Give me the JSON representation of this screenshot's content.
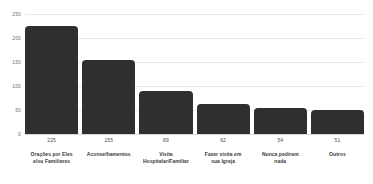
{
  "chart_data": {
    "type": "bar",
    "title": "",
    "subtitle": "",
    "xlabel": "",
    "ylabel": "",
    "ylim": [
      0,
      250
    ],
    "yticks": [
      0,
      50,
      100,
      150,
      200,
      250
    ],
    "ytick_labels": [
      "0",
      "50",
      "100",
      "150",
      "200",
      "250"
    ],
    "grid": true,
    "legend": false,
    "bar_color": "#2f2f2f",
    "gridline_color": "#e9e9e9",
    "background_color": "#ffffff",
    "categories": [
      "Orações por Eles\ne/ou Familiares",
      "Aconselhamentos",
      "Visita\nHospitalar/Familiar",
      "Fazer visita em\nsua Igreja",
      "Nunca pediram\nnada",
      "Outros"
    ],
    "values": [
      225,
      155,
      89,
      62,
      54,
      51
    ],
    "value_labels": [
      "225",
      "155",
      "89",
      "62",
      "54",
      "51"
    ]
  }
}
